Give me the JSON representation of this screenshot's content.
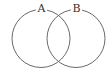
{
  "diagram": {
    "type": "venn",
    "sets": [
      {
        "label": "A",
        "cx": 41,
        "cy": 38.5,
        "r": 29
      },
      {
        "label": "B",
        "cx": 76,
        "cy": 38.5,
        "r": 29
      }
    ],
    "stroke_color": "#6a6a6a",
    "label_color": "#333333",
    "background": "#ffffff"
  }
}
